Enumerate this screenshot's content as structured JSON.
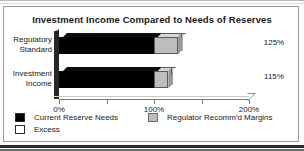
{
  "frame": {
    "name": "chart-figure"
  },
  "chart_data": {
    "type": "bar",
    "orientation": "horizontal",
    "stacked": true,
    "title": "Investment Income Compared to Needs of Reserves",
    "xlabel": "",
    "ylabel": "",
    "categories": [
      "Regulatory Standard",
      "Investment Income"
    ],
    "category_lines": [
      [
        "Regulatory",
        "Standard"
      ],
      [
        "Investment",
        "Income"
      ]
    ],
    "series": [
      {
        "name": "Current Reserve Needs",
        "color": "#000000",
        "values": [
          100,
          100
        ]
      },
      {
        "name": "Regulator Recomm'd Margins",
        "color": "#bdbdbd",
        "values": [
          25,
          15
        ]
      }
    ],
    "totals": [
      125,
      115
    ],
    "data_labels": [
      "125%",
      "115%"
    ],
    "xlim": [
      0,
      200
    ],
    "xticks": [
      0,
      50,
      100,
      150,
      200
    ],
    "xtick_labels": [
      "0%",
      "",
      "100%",
      "",
      "200%"
    ],
    "grid": false,
    "legend": {
      "position": "bottom",
      "entries": [
        {
          "label": "Current Reserve Needs",
          "swatch": "black"
        },
        {
          "label": "Excess",
          "swatch": "white"
        },
        {
          "label": "Regulator Recomm'd Margins",
          "swatch": "gray"
        }
      ]
    },
    "colors": {
      "current_reserve_needs": "#000000",
      "excess": "#ffffff",
      "regulator_margins": "#bdbdbd",
      "axis": "#7c7c7c",
      "text": "#1a1a1a"
    }
  }
}
